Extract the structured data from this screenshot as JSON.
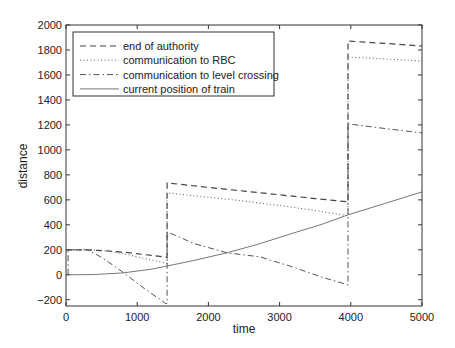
{
  "chart_data": {
    "type": "line",
    "title": "",
    "xlabel": "time",
    "ylabel": "distance",
    "xlim": [
      0,
      5000
    ],
    "ylim": [
      -250,
      2000
    ],
    "xticks": [
      0,
      1000,
      2000,
      3000,
      4000,
      5000
    ],
    "yticks": [
      -200,
      0,
      200,
      400,
      600,
      800,
      1000,
      1200,
      1400,
      1600,
      1800,
      2000
    ],
    "grid": false,
    "legend_position": "upper left",
    "series": [
      {
        "name": "end of authority",
        "style": "dashed",
        "points": [
          [
            0,
            200
          ],
          [
            300,
            200
          ],
          [
            600,
            190
          ],
          [
            900,
            175
          ],
          [
            1200,
            155
          ],
          [
            1420,
            140
          ],
          [
            1420,
            736
          ],
          [
            2000,
            700
          ],
          [
            2500,
            670
          ],
          [
            3000,
            640
          ],
          [
            3500,
            610
          ],
          [
            3960,
            584
          ],
          [
            3960,
            1872
          ],
          [
            4500,
            1852
          ],
          [
            5000,
            1832
          ]
        ]
      },
      {
        "name": "communication to RBC",
        "style": "dotted",
        "points": [
          [
            0,
            200
          ],
          [
            300,
            200
          ],
          [
            500,
            195
          ],
          [
            800,
            170
          ],
          [
            1100,
            130
          ],
          [
            1420,
            90
          ],
          [
            1420,
            656
          ],
          [
            2000,
            620
          ],
          [
            2500,
            590
          ],
          [
            3000,
            555
          ],
          [
            3500,
            515
          ],
          [
            3960,
            472
          ],
          [
            3960,
            1744
          ],
          [
            4500,
            1728
          ],
          [
            5000,
            1712
          ]
        ]
      },
      {
        "name": "communication to level crossing",
        "style": "dashdot",
        "points": [
          [
            30,
            0
          ],
          [
            30,
            200
          ],
          [
            300,
            200
          ],
          [
            500,
            140
          ],
          [
            800,
            20
          ],
          [
            1100,
            -110
          ],
          [
            1400,
            -230
          ],
          [
            1420,
            -230
          ],
          [
            1420,
            344
          ],
          [
            1800,
            250
          ],
          [
            2260,
            176
          ],
          [
            2720,
            144
          ],
          [
            3200,
            60
          ],
          [
            3600,
            -20
          ],
          [
            3960,
            -80
          ],
          [
            3960,
            1208
          ],
          [
            4500,
            1170
          ],
          [
            5000,
            1136
          ]
        ]
      },
      {
        "name": "current position of train",
        "style": "solid",
        "points": [
          [
            0,
            0
          ],
          [
            400,
            2
          ],
          [
            800,
            15
          ],
          [
            1200,
            45
          ],
          [
            1420,
            70
          ],
          [
            1800,
            115
          ],
          [
            2260,
            176
          ],
          [
            2700,
            245
          ],
          [
            3200,
            335
          ],
          [
            3600,
            405
          ],
          [
            3960,
            480
          ],
          [
            4500,
            575
          ],
          [
            5000,
            664
          ]
        ]
      }
    ]
  }
}
